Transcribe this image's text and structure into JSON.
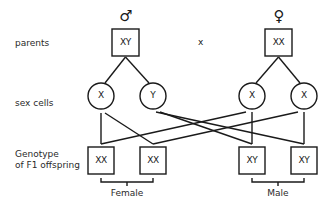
{
  "row_labels": {
    "parents": "parents",
    "sex_cells": "sex cells",
    "genotype_line1": "Genotype",
    "genotype_line2": "of F1 offspring"
  },
  "parents": {
    "male": {
      "symbol": "♂",
      "genotype": "XY"
    },
    "female": {
      "symbol": "♀",
      "genotype": "XX"
    },
    "cross_symbol": "x"
  },
  "sex_cells": {
    "male": [
      "X",
      "Y"
    ],
    "female": [
      "X",
      "X"
    ]
  },
  "offspring": [
    {
      "genotype": "XX"
    },
    {
      "genotype": "XX"
    },
    {
      "genotype": "XY"
    },
    {
      "genotype": "XY"
    }
  ],
  "groups": {
    "female": "Female",
    "male": "Male"
  },
  "colors": {
    "stroke": "#1a1a1a",
    "background": "#ffffff"
  }
}
